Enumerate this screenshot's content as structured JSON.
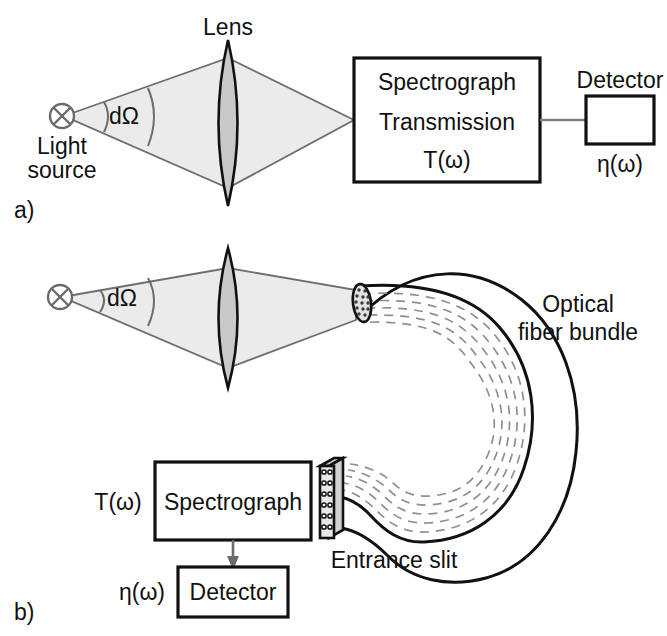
{
  "panel_a": {
    "id": "a)",
    "light_source_label": "Light\nsource",
    "light_source_line1": "Light",
    "light_source_line2": "source",
    "solid_angle_label": "dΩ",
    "lens_label": "Lens",
    "spectrograph_line1": "Spectrograph",
    "spectrograph_line2": "Transmission",
    "spectrograph_line3": "T(ω)",
    "detector_label": "Detector",
    "detector_efficiency_label": "η(ω)"
  },
  "panel_b": {
    "id": "b)",
    "solid_angle_label": "dΩ",
    "fiber_bundle_line1": "Optical",
    "fiber_bundle_line2": "fiber bundle",
    "entrance_slit_label": "Entrance slit",
    "spectrograph_label": "Spectrograph",
    "transmission_label": "T(ω)",
    "detector_label": "Detector",
    "detector_efficiency_label": "η(ω)"
  },
  "colors": {
    "beam_fill": "#ebebeb",
    "beam_stroke": "#6e6e6e",
    "lens_fill": "#c9c9c9",
    "outline": "#111111",
    "dash_gray": "#8f8f8f",
    "background": "#ffffff"
  }
}
